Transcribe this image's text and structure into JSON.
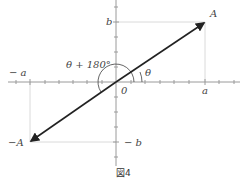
{
  "figure": {
    "caption": "図4",
    "labels": {
      "A": "A",
      "neg_A": "−A",
      "a": "a",
      "neg_a": "− a",
      "b": "b",
      "neg_b": "− b",
      "origin": "0",
      "theta": "θ",
      "theta_plus_180": "θ + 180°"
    },
    "colors": {
      "axis": "#9a9a9a",
      "vector": "#222222",
      "guide": "#cfcfcf",
      "arc": "#555555"
    }
  }
}
